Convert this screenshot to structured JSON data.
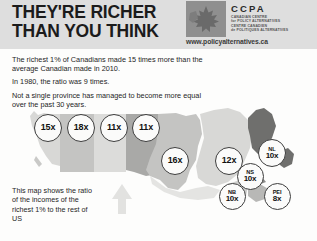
{
  "header": {
    "title_line1": "THEY'RE RICHER",
    "title_line2": "THAN YOU THINK",
    "logo": {
      "acronym": "CCPA",
      "sub_line1": "CANADIAN CENTRE",
      "sub_line2": "for POLICY ALTERNATIVES",
      "sub_line3": "CENTRE CANADIEN",
      "sub_line4": "de POLITIQUES ALTERNATIVES",
      "url": "www.policyalternatives.ca"
    }
  },
  "body": {
    "para1": "The richest 1% of Canadians made 15 times more than the average Canadian made in 2010.",
    "para2": "In 1980, the ratio was 9 times.",
    "para3": "Not a single province has managed to become more equal over the past 30 years."
  },
  "caption": {
    "text": "This map shows the ratio of the incomes of the richest 1% to the rest of US"
  },
  "map": {
    "colors": {
      "band_lightest": "#e8e8e6",
      "band_light": "#d8d8d6",
      "band_mid": "#c4c4c2",
      "band_dark": "#a9a9a7",
      "band_darkest": "#6f6f6d",
      "bubble_fill": "#fbfbfa",
      "bubble_stroke": "#3d3d3d",
      "arrow": "#e2e2e0",
      "header_band": "#dedede"
    },
    "bubbles": [
      {
        "id": "bc",
        "province": "",
        "ratio": "15x",
        "x": 48,
        "y": 128,
        "size": 28
      },
      {
        "id": "ab",
        "province": "",
        "ratio": "18x",
        "x": 81,
        "y": 128,
        "size": 28
      },
      {
        "id": "sk",
        "province": "",
        "ratio": "11x",
        "x": 114,
        "y": 128,
        "size": 28
      },
      {
        "id": "mb",
        "province": "",
        "ratio": "11x",
        "x": 146,
        "y": 128,
        "size": 28
      },
      {
        "id": "on",
        "province": "",
        "ratio": "16x",
        "x": 175,
        "y": 161,
        "size": 28
      },
      {
        "id": "qc",
        "province": "",
        "ratio": "12x",
        "x": 229,
        "y": 161,
        "size": 28
      },
      {
        "id": "nl",
        "province": "NL",
        "ratio": "10x",
        "x": 272,
        "y": 153,
        "size": 28
      },
      {
        "id": "ns",
        "province": "NS",
        "ratio": "10x",
        "x": 250,
        "y": 176,
        "size": 27
      },
      {
        "id": "nb",
        "province": "NB",
        "ratio": "10x",
        "x": 232,
        "y": 196,
        "size": 27
      },
      {
        "id": "pei",
        "province": "PEI",
        "ratio": "8x",
        "x": 277,
        "y": 196,
        "size": 27
      }
    ]
  }
}
